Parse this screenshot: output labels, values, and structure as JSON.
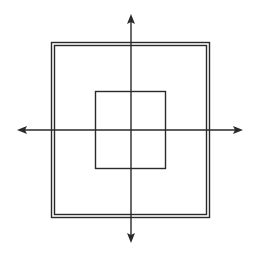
{
  "diagram": {
    "colors": {
      "background": "#ffffff",
      "stroke": "#2a2a2a"
    },
    "axes": {
      "origin": [
        131,
        130
      ],
      "horizontal": {
        "x1": 17,
        "x2": 243,
        "y": 130,
        "arrows": "both"
      },
      "vertical": {
        "y1": 14,
        "y2": 243,
        "x": 131,
        "arrows": "both"
      }
    },
    "outer_square": {
      "style": "double-line",
      "outer": {
        "x": 51.5,
        "y": 42.5,
        "width": 158,
        "height": 175
      },
      "inner": {
        "x": 54.5,
        "y": 45.5,
        "width": 152,
        "height": 169
      }
    },
    "inner_square": {
      "x": 95.5,
      "y": 91.5,
      "width": 70,
      "height": 77
    }
  }
}
